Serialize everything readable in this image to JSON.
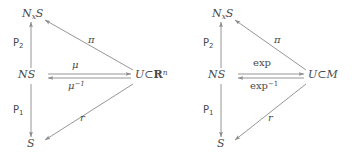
{
  "figure": {
    "background_color": "#ffffff",
    "stroke_color": "#8a8a8a",
    "text_color": "#4a4a4a",
    "type": "commutative-diagram-pair"
  },
  "diagrams": [
    {
      "id": "left",
      "nodes": {
        "top_left": {
          "base": "N",
          "subscript": "x",
          "tail": "S"
        },
        "middle_left": {
          "base": "NS"
        },
        "bottom_left": {
          "base": "S"
        },
        "right": {
          "base": "U",
          "relation": "⊂",
          "target": "R",
          "exponent": "n"
        }
      },
      "labels": {
        "vertical_upper": {
          "letter": "P",
          "subscript": "2"
        },
        "vertical_lower": {
          "letter": "P",
          "subscript": "1"
        },
        "diagonal_upper": "π",
        "diagonal_lower": "r",
        "horizontal_forward": "μ",
        "horizontal_backward": {
          "base": "μ",
          "exponent": "−1"
        }
      }
    },
    {
      "id": "right",
      "nodes": {
        "top_left": {
          "base": "N",
          "subscript": "x",
          "tail": "S"
        },
        "middle_left": {
          "base": "NS"
        },
        "bottom_left": {
          "base": "S"
        },
        "right": {
          "base": "U",
          "relation": "⊂",
          "target": "M",
          "exponent": ""
        }
      },
      "labels": {
        "vertical_upper": {
          "letter": "P",
          "subscript": "2"
        },
        "vertical_lower": {
          "letter": "P",
          "subscript": "1"
        },
        "diagonal_upper": "π",
        "diagonal_lower": "r",
        "horizontal_forward": "exp",
        "horizontal_backward": {
          "base": "exp",
          "exponent": "−1"
        }
      }
    }
  ]
}
